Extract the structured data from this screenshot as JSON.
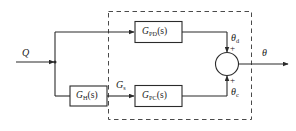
{
  "diagram": {
    "stroke_color": "#2b2b2b",
    "dashed_color": "#4a4a4a",
    "background": "#ffffff",
    "input": {
      "label": "Q",
      "name": "input-signal-Q"
    },
    "output": {
      "label": "θ",
      "name": "output-signal-theta"
    },
    "blocks": [
      {
        "id": "g-pd",
        "base": "G",
        "subscript": "PD",
        "arg": "(s)",
        "label": "G_PD(s)"
      },
      {
        "id": "g-h",
        "base": "G",
        "subscript": "H",
        "arg": "(s)",
        "label": "G_H(s)"
      },
      {
        "id": "g-pc",
        "base": "G",
        "subscript": "PC",
        "arg": "(s)",
        "label": "G_PC(s)"
      }
    ],
    "intermediate_signals": [
      {
        "id": "g-s",
        "base": "G",
        "subscript": "s",
        "label": "G_s"
      },
      {
        "id": "theta-d",
        "base": "θ",
        "subscript": "d",
        "label": "θ_d"
      },
      {
        "id": "theta-c",
        "base": "θ",
        "subscript": "c",
        "label": "θ_c"
      }
    ],
    "summing_junction": {
      "name": "summing-junction",
      "top_sign": "+",
      "bottom_sign": "+"
    },
    "dashed_boundary": {
      "name": "dashed-boundary-box",
      "style": "dashed"
    }
  }
}
